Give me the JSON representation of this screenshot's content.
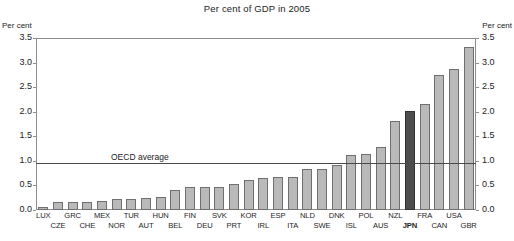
{
  "chart_data": {
    "type": "bar",
    "title": "Per cent of GDP in 2005",
    "xlabel": "",
    "ylabel": "Per cent",
    "ylabel_right": "Per cent",
    "ylim": [
      0.0,
      3.5
    ],
    "yticks": [
      "0.0",
      "0.5",
      "1.0",
      "1.5",
      "2.0",
      "2.5",
      "3.0",
      "3.5"
    ],
    "ytick_values": [
      0.0,
      0.5,
      1.0,
      1.5,
      2.0,
      2.5,
      3.0,
      3.5
    ],
    "grid": false,
    "legend": "none",
    "categories": [
      "LUX",
      "CZE",
      "GRC",
      "CHE",
      "MEX",
      "NOR",
      "TUR",
      "AUT",
      "HUN",
      "BEL",
      "FIN",
      "DEU",
      "SVK",
      "PRT",
      "KOR",
      "IRL",
      "ESP",
      "ITA",
      "NLD",
      "SWE",
      "DNK",
      "ISL",
      "POL",
      "AUS",
      "NZL",
      "JPN",
      "FRA",
      "CAN",
      "USA",
      "GBR"
    ],
    "values": [
      0.07,
      0.17,
      0.17,
      0.17,
      0.19,
      0.22,
      0.23,
      0.25,
      0.27,
      0.4,
      0.47,
      0.46,
      0.46,
      0.52,
      0.62,
      0.65,
      0.68,
      0.68,
      0.83,
      0.84,
      0.92,
      1.12,
      1.14,
      1.29,
      1.82,
      2.02,
      2.15,
      2.75,
      2.87,
      3.32
    ],
    "highlight_category": "JPN",
    "annotations": [
      {
        "name": "oecd-average",
        "label": "OECD average",
        "value": 0.96,
        "type": "horizontal-line"
      }
    ],
    "colors": {
      "bar_fill": "#b9b9b9",
      "bar_stroke": "#6f6f6f",
      "highlight_fill": "#4d4d4d",
      "highlight_stroke": "#333333",
      "axis": "#8d8d8d",
      "reference_line": "#4a4a4a",
      "text": "#1e1e1e",
      "background": "#ffffff"
    }
  }
}
